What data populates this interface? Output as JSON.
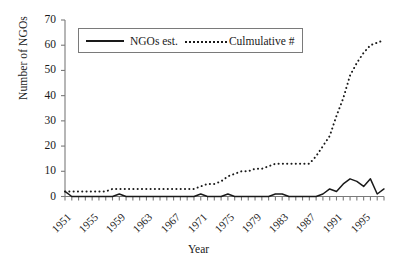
{
  "chart_data": {
    "type": "line",
    "title": "",
    "xlabel": "Year",
    "ylabel": "Number of NGOs",
    "xlim": [
      1951,
      1998
    ],
    "ylim": [
      0,
      70
    ],
    "yticks": [
      0,
      10,
      20,
      30,
      40,
      50,
      60,
      70
    ],
    "xticks": [
      1951,
      1955,
      1959,
      1963,
      1967,
      1971,
      1975,
      1979,
      1983,
      1987,
      1991,
      1995
    ],
    "grid": false,
    "legend_position": "top-center",
    "x": [
      1951,
      1952,
      1953,
      1954,
      1955,
      1956,
      1957,
      1958,
      1959,
      1960,
      1961,
      1962,
      1963,
      1964,
      1965,
      1966,
      1967,
      1968,
      1969,
      1970,
      1971,
      1972,
      1973,
      1974,
      1975,
      1976,
      1977,
      1978,
      1979,
      1980,
      1981,
      1982,
      1983,
      1984,
      1985,
      1986,
      1987,
      1988,
      1989,
      1990,
      1991,
      1992,
      1993,
      1994,
      1995,
      1996,
      1997,
      1998
    ],
    "series": [
      {
        "name": "NGOs est.",
        "style": "solid",
        "values": [
          2,
          0,
          0,
          0,
          0,
          0,
          0,
          0,
          1,
          0,
          0,
          0,
          0,
          0,
          0,
          0,
          0,
          0,
          0,
          0,
          1,
          0,
          0,
          0,
          1,
          0,
          0,
          0,
          0,
          0,
          0,
          1,
          1,
          0,
          0,
          0,
          0,
          0,
          1,
          3,
          2,
          5,
          7,
          6,
          4,
          7,
          1,
          3
        ]
      },
      {
        "name": "Culmulative #",
        "style": "dotted",
        "values": [
          2,
          2,
          2,
          2,
          2,
          2,
          2,
          3,
          3,
          3,
          3,
          3,
          3,
          3,
          3,
          3,
          3,
          3,
          3,
          3,
          4,
          5,
          5,
          6,
          8,
          9,
          10,
          10,
          11,
          11,
          12,
          13,
          13,
          13,
          13,
          13,
          13,
          16,
          20,
          24,
          32,
          39,
          48,
          53,
          57,
          60,
          61,
          62
        ]
      }
    ]
  },
  "legend": {
    "entries": [
      {
        "label": "NGOs est.",
        "style": "solid"
      },
      {
        "label": "Culmulative #",
        "style": "dotted"
      }
    ]
  },
  "axes": {
    "y_title": "Number of NGOs",
    "x_title": "Year"
  },
  "colors": {
    "line": "#1a1a1a",
    "frame": "#7a7a7a",
    "background": "#ffffff"
  }
}
